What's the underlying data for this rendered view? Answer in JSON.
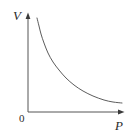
{
  "figure": {
    "name": "pressure-volume-inverse-curve",
    "background_color": "#ffffff",
    "line_color": "#4a4a4a",
    "axis_color": "#555555",
    "text_color": "#2b2b2b"
  },
  "labels": {
    "y_axis": "V",
    "x_axis": "P",
    "origin": "0"
  },
  "chart_data": {
    "type": "line",
    "title": "",
    "xlabel": "P",
    "ylabel": "V",
    "grid": false,
    "legend": null,
    "xlim": [
      0,
      131
    ],
    "ylim": [
      0,
      137
    ],
    "axes": {
      "origin_px": [
        28,
        112
      ],
      "y_axis_top_px": [
        28,
        14
      ],
      "x_axis_right_px": [
        124,
        112
      ],
      "arrowheads": [
        "y-axis-top",
        "x-axis-right"
      ]
    },
    "series": [
      {
        "name": "inverse-relation",
        "description": "hyperbola, V inversely proportional to P",
        "points_px": [
          [
            37,
            18
          ],
          [
            39,
            26
          ],
          [
            41,
            34
          ],
          [
            44,
            43
          ],
          [
            48,
            53
          ],
          [
            53,
            62
          ],
          [
            59,
            70
          ],
          [
            66,
            78
          ],
          [
            74,
            85
          ],
          [
            83,
            91
          ],
          [
            93,
            96
          ],
          [
            104,
            100
          ],
          [
            113,
            102
          ],
          [
            122,
            103
          ]
        ]
      }
    ]
  }
}
